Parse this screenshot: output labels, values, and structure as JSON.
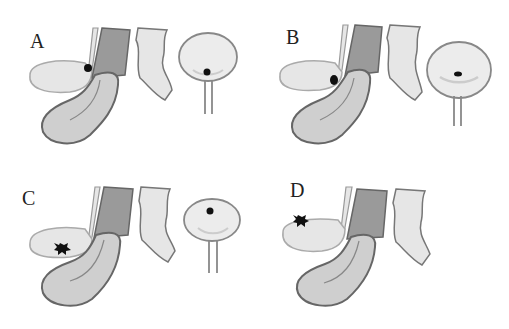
{
  "panels": [
    {
      "id": "A",
      "label": "A",
      "lesion_location": "junction near dark tube",
      "bladder_lesion": "base",
      "show_bladder": true
    },
    {
      "id": "B",
      "label": "B",
      "lesion_location": "lower end of upper lobe",
      "bladder_lesion": "center",
      "show_bladder": true
    },
    {
      "id": "C",
      "label": "C",
      "lesion_location": "bottom of upper lobe",
      "bladder_lesion": "dome",
      "show_bladder": true
    },
    {
      "id": "D",
      "label": "D",
      "lesion_location": "top of upper lobe",
      "bladder_lesion": "none",
      "show_bladder": false
    }
  ],
  "colors": {
    "outline": "#7a7a7a",
    "light_fill": "#e6e6e6",
    "mid_fill": "#cfcfcf",
    "dark_fill": "#9a9a9a",
    "lesion": "#111111"
  }
}
